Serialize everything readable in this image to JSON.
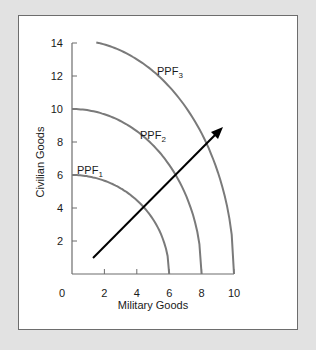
{
  "chart_data": {
    "type": "line",
    "title": "",
    "xlabel": "Military Goods",
    "ylabel": "Civilian Goods",
    "xlim": [
      0,
      10
    ],
    "ylim": [
      0,
      14
    ],
    "x_ticks": [
      "0",
      "2",
      "4",
      "6",
      "8",
      "10"
    ],
    "y_ticks": [
      "2",
      "4",
      "6",
      "8",
      "10",
      "12",
      "14"
    ],
    "grid": false,
    "legend": "none",
    "series": [
      {
        "name": "PPF1",
        "label_main": "PPF",
        "label_sub": "1",
        "x_intercept": 6,
        "y_intercept": 6,
        "color": "#7a7a7a"
      },
      {
        "name": "PPF2",
        "label_main": "PPF",
        "label_sub": "2",
        "x_intercept": 8,
        "y_intercept": 10,
        "color": "#7a7a7a"
      },
      {
        "name": "PPF3",
        "label_main": "PPF",
        "label_sub": "3",
        "x_intercept": 10,
        "y_intercept": 14.2,
        "start_x": 1.5,
        "color": "#7a7a7a"
      }
    ],
    "annotations": [
      {
        "type": "arrow",
        "from": [
          1.3,
          1.0
        ],
        "to": [
          9.3,
          8.9
        ],
        "color": "#000000",
        "description": "outward shift of production possibilities frontier"
      }
    ]
  },
  "axes": {
    "origin_label": "0"
  }
}
